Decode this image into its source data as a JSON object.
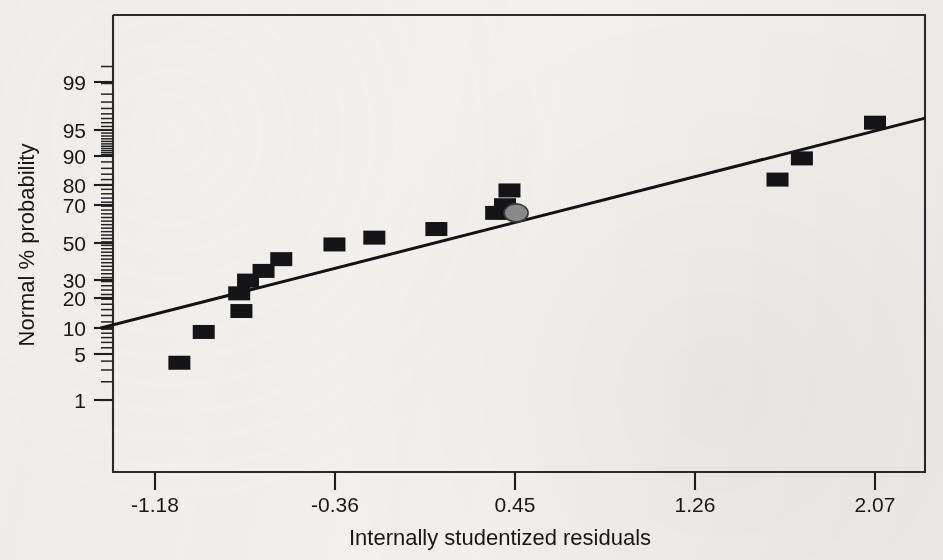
{
  "chart_data": {
    "type": "scatter",
    "title": "",
    "xlabel": "Internally studentized residuals",
    "ylabel": "Normal % probability",
    "xtick_labels": [
      "-1.18",
      "-0.36",
      "0.45",
      "1.26",
      "2.07"
    ],
    "xticks": [
      -1.18,
      -0.36,
      0.45,
      1.26,
      2.07
    ],
    "ytick_labels": [
      "99",
      "95",
      "90",
      "80",
      "70",
      "50",
      "30",
      "20",
      "10",
      "5",
      "1"
    ],
    "yticks": [
      99,
      95,
      90,
      80,
      70,
      50,
      30,
      20,
      10,
      5,
      1
    ],
    "xlim": [
      -1.42,
      2.29
    ],
    "ylim": [
      0.35,
      99.8
    ],
    "grid": false,
    "legend": false,
    "y_scale": "normal-probability",
    "series": [
      {
        "name": "residual points",
        "marker": "filled-square",
        "color": "#141416",
        "points": [
          {
            "x": -1.07,
            "y": 3.8
          },
          {
            "x": -0.96,
            "y": 9.3
          },
          {
            "x": -0.79,
            "y": 15.5
          },
          {
            "x": -0.8,
            "y": 22.5
          },
          {
            "x": -0.76,
            "y": 28.5
          },
          {
            "x": -0.69,
            "y": 33.5
          },
          {
            "x": -0.61,
            "y": 40.0
          },
          {
            "x": -0.37,
            "y": 48.5
          },
          {
            "x": -0.19,
            "y": 52.5
          },
          {
            "x": 0.09,
            "y": 57.5
          },
          {
            "x": 0.36,
            "y": 66.5
          },
          {
            "x": 0.4,
            "y": 70.5
          },
          {
            "x": 0.42,
            "y": 77.5
          },
          {
            "x": 1.63,
            "y": 82.0
          },
          {
            "x": 1.74,
            "y": 89.0
          },
          {
            "x": 2.07,
            "y": 96.0
          }
        ]
      },
      {
        "name": "highlighted point",
        "marker": "filled-ellipse",
        "color": "#8b8b8b",
        "points": [
          {
            "x": 0.45,
            "y": 66.5
          }
        ]
      }
    ],
    "reference_line": {
      "name": "normal reference line",
      "color": "#121214",
      "start": {
        "x": -1.42,
        "y": 10.4
      },
      "end": {
        "x": 2.29,
        "y": 96.5
      }
    }
  },
  "axes": {
    "x_title": "Internally studentized residuals",
    "y_title": "Normal % probability",
    "x_labels": [
      "-1.18",
      "-0.36",
      "0.45",
      "1.26",
      "2.07"
    ],
    "y_labels": [
      "99",
      "95",
      "90",
      "80",
      "70",
      "50",
      "30",
      "20",
      "10",
      "5",
      "1"
    ]
  },
  "colors": {
    "background": "#f2f1ee",
    "ink": "#17171a",
    "point": "#141416",
    "highlight": "#8b8b8b",
    "line": "#121214"
  }
}
